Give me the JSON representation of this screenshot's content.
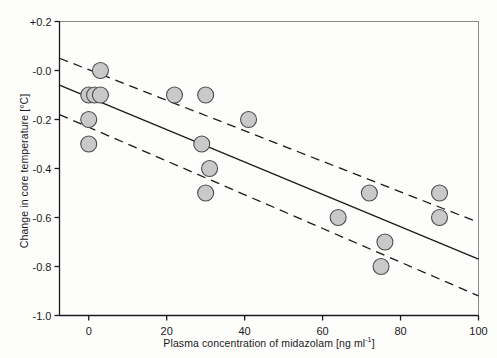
{
  "chart_data": {
    "type": "scatter",
    "title": "",
    "xlabel": "Plasma concentration of midazolam [ng ml",
    "xlabel_sup": "-1",
    "xlabel_tail": "]",
    "ylabel": "Change in core temperature [°C]",
    "xlim": [
      -7.5,
      100
    ],
    "ylim": [
      -1.0,
      0.2
    ],
    "xticks": [
      0,
      20,
      40,
      60,
      80,
      100
    ],
    "xticklabels": [
      "0",
      "20",
      "40",
      "60",
      "80",
      "100"
    ],
    "yticks": [
      0.2,
      0.0,
      -0.2,
      -0.4,
      -0.6,
      -0.8,
      -1.0
    ],
    "yticklabels": [
      "+0.2",
      "-0.0",
      "-0.2",
      "-0.4",
      "-0.6",
      "-0.8",
      "-1.0"
    ],
    "grid": false,
    "legend": null,
    "marker": {
      "shape": "circle",
      "fill": "#c9c9c9",
      "edge": "#4d4d4d",
      "radius_px": 8
    },
    "points": [
      {
        "x": 3,
        "y": 0.0
      },
      {
        "x": 0,
        "y": -0.1
      },
      {
        "x": 1.5,
        "y": -0.1
      },
      {
        "x": 3,
        "y": -0.1
      },
      {
        "x": 0,
        "y": -0.2
      },
      {
        "x": 0,
        "y": -0.3
      },
      {
        "x": 22,
        "y": -0.1
      },
      {
        "x": 30,
        "y": -0.1
      },
      {
        "x": 41,
        "y": -0.2
      },
      {
        "x": 29,
        "y": -0.3
      },
      {
        "x": 31,
        "y": -0.4
      },
      {
        "x": 30,
        "y": -0.5
      },
      {
        "x": 64,
        "y": -0.6
      },
      {
        "x": 72,
        "y": -0.5
      },
      {
        "x": 76,
        "y": -0.7
      },
      {
        "x": 75,
        "y": -0.8
      },
      {
        "x": 90,
        "y": -0.5
      },
      {
        "x": 90,
        "y": -0.6
      }
    ],
    "regression_line": {
      "style": "solid",
      "color": "#1b1b1b",
      "x1": -7.5,
      "y1": -0.06,
      "x2": 100,
      "y2": -0.77
    },
    "confidence_band_upper": {
      "style": "dashed",
      "color": "#1b1b1b",
      "x1": -7.5,
      "y1": 0.05,
      "x2": 100,
      "y2": -0.62
    },
    "confidence_band_lower": {
      "style": "dashed",
      "color": "#1b1b1b",
      "x1": -7.5,
      "y1": -0.18,
      "x2": 100,
      "y2": -0.92
    }
  }
}
